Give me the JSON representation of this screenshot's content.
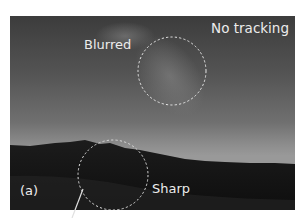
{
  "figure": {
    "panel_label": "(a)",
    "title": "No tracking",
    "annotations": [
      {
        "label": "Blurred",
        "region": "sky / Milky Way",
        "circle": {
          "cx": 172,
          "cy": 71,
          "r": 34
        }
      },
      {
        "label": "Sharp",
        "region": "hillside foreground",
        "circle": {
          "cx": 113,
          "cy": 175,
          "r": 35
        }
      }
    ],
    "colors": {
      "annotation": "#ececec",
      "sky_top": "#3c3c3c",
      "sky_horizon": "#999999",
      "ground": "#141414"
    }
  }
}
